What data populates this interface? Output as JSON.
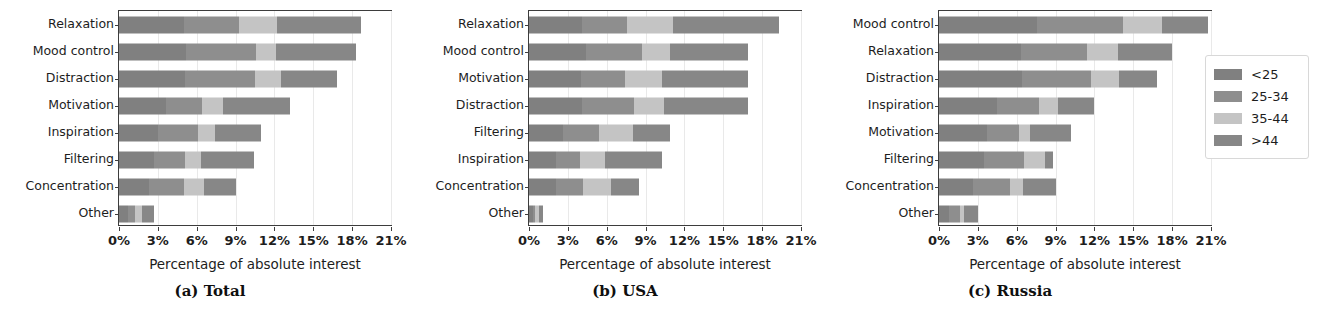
{
  "figure": {
    "panels": [
      {
        "key": "a",
        "caption": "(a) Total"
      },
      {
        "key": "b",
        "caption": "(b) USA"
      },
      {
        "key": "c",
        "caption": "(c) Russia"
      }
    ],
    "xaxis_title": "Percentage of absolute interest",
    "xtick_labels": [
      "0%",
      "3%",
      "6%",
      "9%",
      "12%",
      "15%",
      "18%",
      "21%"
    ]
  },
  "legend": {
    "title": "",
    "entries": [
      {
        "label": "<25",
        "color": "#808080"
      },
      {
        "label": "25-34",
        "color": "#8e8e8e"
      },
      {
        "label": "35-44",
        "color": "#c4c4c4"
      },
      {
        "label": ">44",
        "color": "#878787"
      }
    ]
  },
  "chart_data": [
    {
      "type": "bar",
      "orientation": "horizontal",
      "stacked": true,
      "title": "(a) Total",
      "xlabel": "Percentage of absolute interest",
      "ylabel": "",
      "xlim": [
        0,
        21
      ],
      "xticks": [
        0,
        3,
        6,
        9,
        12,
        15,
        18,
        21
      ],
      "xtick_labels": [
        "0%",
        "3%",
        "6%",
        "9%",
        "12%",
        "15%",
        "18%",
        "21%"
      ],
      "grid": true,
      "legend_position": "outside-right",
      "categories": [
        "Relaxation",
        "Mood control",
        "Distraction",
        "Motivation",
        "Inspiration",
        "Filtering",
        "Concentration",
        "Other"
      ],
      "series": [
        {
          "name": "<25",
          "values": [
            5.0,
            5.2,
            5.1,
            3.6,
            3.0,
            2.7,
            2.3,
            0.7
          ]
        },
        {
          "name": "25-34",
          "values": [
            4.3,
            5.4,
            5.4,
            2.8,
            3.1,
            2.4,
            2.7,
            0.5
          ]
        },
        {
          "name": "35-44",
          "values": [
            2.9,
            1.5,
            2.0,
            1.6,
            1.3,
            1.2,
            1.6,
            0.6
          ]
        },
        {
          "name": ">44",
          "values": [
            6.5,
            6.2,
            4.3,
            5.2,
            3.6,
            4.1,
            2.4,
            0.9
          ]
        }
      ],
      "totals": [
        18.7,
        18.3,
        16.8,
        13.2,
        11.0,
        10.4,
        9.0,
        2.7
      ]
    },
    {
      "type": "bar",
      "orientation": "horizontal",
      "stacked": true,
      "title": "(b) USA",
      "xlabel": "Percentage of absolute interest",
      "ylabel": "",
      "xlim": [
        0,
        21
      ],
      "xticks": [
        0,
        3,
        6,
        9,
        12,
        15,
        18,
        21
      ],
      "xtick_labels": [
        "0%",
        "3%",
        "6%",
        "9%",
        "12%",
        "15%",
        "18%",
        "21%"
      ],
      "grid": true,
      "legend_position": "outside-right",
      "categories": [
        "Relaxation",
        "Mood control",
        "Motivation",
        "Distraction",
        "Filtering",
        "Inspiration",
        "Concentration",
        "Other"
      ],
      "series": [
        {
          "name": "<25",
          "values": [
            4.1,
            4.4,
            4.0,
            4.1,
            2.6,
            2.1,
            2.1,
            0.3
          ]
        },
        {
          "name": "25-34",
          "values": [
            3.5,
            4.3,
            3.4,
            4.0,
            2.8,
            1.8,
            2.1,
            0.2
          ]
        },
        {
          "name": "35-44",
          "values": [
            3.5,
            2.2,
            2.9,
            2.3,
            2.6,
            2.0,
            2.1,
            0.3
          ]
        },
        {
          "name": ">44",
          "values": [
            8.2,
            6.0,
            6.6,
            6.5,
            2.9,
            4.4,
            2.2,
            0.3
          ]
        }
      ],
      "totals": [
        19.3,
        16.9,
        16.9,
        16.9,
        10.9,
        10.3,
        8.5,
        1.1
      ]
    },
    {
      "type": "bar",
      "orientation": "horizontal",
      "stacked": true,
      "title": "(c) Russia",
      "xlabel": "Percentage of absolute interest",
      "ylabel": "",
      "xlim": [
        0,
        21
      ],
      "xticks": [
        0,
        3,
        6,
        9,
        12,
        15,
        18,
        21
      ],
      "xtick_labels": [
        "0%",
        "3%",
        "6%",
        "9%",
        "12%",
        "15%",
        "18%",
        "21%"
      ],
      "grid": true,
      "legend_position": "outside-right",
      "categories": [
        "Mood control",
        "Relaxation",
        "Distraction",
        "Inspiration",
        "Motivation",
        "Filtering",
        "Concentration",
        "Other"
      ],
      "series": [
        {
          "name": "<25",
          "values": [
            7.6,
            6.3,
            6.4,
            4.5,
            3.7,
            3.5,
            2.6,
            0.8
          ]
        },
        {
          "name": "25-34",
          "values": [
            6.6,
            5.1,
            5.3,
            3.2,
            2.5,
            3.1,
            2.9,
            0.8
          ]
        },
        {
          "name": "35-44",
          "values": [
            3.0,
            2.4,
            2.2,
            1.5,
            0.8,
            1.6,
            1.0,
            0.3
          ]
        },
        {
          "name": ">44",
          "values": [
            3.6,
            4.2,
            2.9,
            2.8,
            3.2,
            0.6,
            2.5,
            1.1
          ]
        }
      ],
      "totals": [
        20.8,
        18.0,
        16.8,
        12.0,
        10.2,
        8.8,
        9.0,
        3.0
      ]
    }
  ]
}
